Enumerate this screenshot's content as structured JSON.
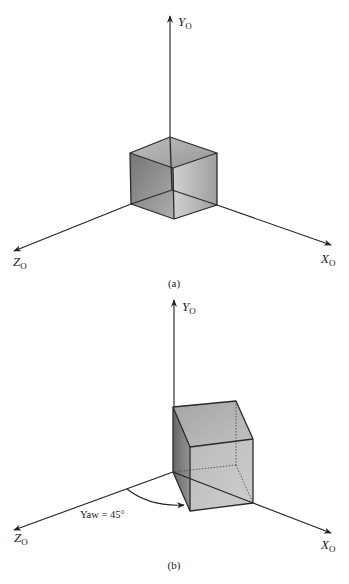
{
  "figures": [
    {
      "id": "a",
      "caption": "(a)",
      "axes": {
        "y_label": "Y",
        "y_sub": "O",
        "x_label": "X",
        "x_sub": "O",
        "z_label": "Z",
        "z_sub": "O"
      }
    },
    {
      "id": "b",
      "caption": "(b)",
      "axes": {
        "y_label": "Y",
        "y_sub": "O",
        "x_label": "X",
        "x_sub": "O",
        "z_label": "Z",
        "z_sub": "O"
      },
      "annotation": "Yaw = 45°"
    }
  ],
  "colors": {
    "background": "#ffffff",
    "line": "#222222",
    "cube_light": "#d2d2d2",
    "cube_dark": "#7a7a7a"
  }
}
